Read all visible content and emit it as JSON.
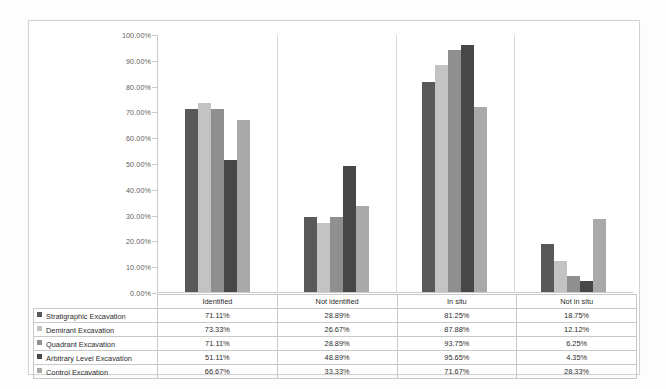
{
  "chart_data": {
    "type": "bar",
    "title": "",
    "subtitle": "",
    "xlabel": "",
    "ylabel": "",
    "ylim": [
      0,
      100
    ],
    "ytick_labels": [
      "100.00%",
      "90.00%",
      "80.00%",
      "70.00%",
      "60.00%",
      "50.00%",
      "40.00%",
      "30.00%",
      "20.00%",
      "10.00%",
      "0.00%"
    ],
    "ytick_values": [
      100,
      90,
      80,
      70,
      60,
      50,
      40,
      30,
      20,
      10,
      0
    ],
    "grid": false,
    "legend_position": "data-table",
    "categories": [
      "Identified",
      "Not identified",
      "In situ",
      "Not in situ"
    ],
    "series": [
      {
        "name": "Stratigraphic Excavation",
        "color": "#595959",
        "values": [
          71.11,
          28.89,
          81.25,
          18.75
        ],
        "labels": [
          "71.11%",
          "28.89%",
          "81.25%",
          "18.75%"
        ]
      },
      {
        "name": "Demirant Excavation",
        "color": "#c3c3c3",
        "values": [
          73.33,
          26.67,
          87.88,
          12.12
        ],
        "labels": [
          "73.33%",
          "26.67%",
          "87.88%",
          "12.12%"
        ]
      },
      {
        "name": "Quadrant Excavation",
        "color": "#8f8f8f",
        "values": [
          71.11,
          28.89,
          93.75,
          6.25
        ],
        "labels": [
          "71.11%",
          "28.89%",
          "93.75%",
          "6.25%"
        ]
      },
      {
        "name": "Arbitrary Level Excavation",
        "color": "#474747",
        "values": [
          51.11,
          48.89,
          95.65,
          4.35
        ],
        "labels": [
          "51.11%",
          "48.89%",
          "95.65%",
          "4.35%"
        ]
      },
      {
        "name": "Control Excavation",
        "color": "#a9a9a9",
        "values": [
          66.67,
          33.33,
          71.67,
          28.33
        ],
        "labels": [
          "66.67%",
          "33.33%",
          "71.67%",
          "28.33%"
        ]
      }
    ]
  }
}
